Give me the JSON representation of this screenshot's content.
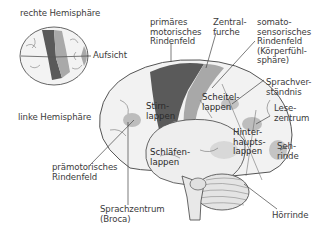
{
  "diagram": {
    "type": "labeled anatomical illustration"
  },
  "top_view": {
    "label_right_hemisphere": "rechte Hemisphäre",
    "label_left_hemisphere": "linke Hemisphäre",
    "label_view": "Aufsicht"
  },
  "labels": {
    "primary_motor": "primäres\nmotorisches\nRindenfeld",
    "central_sulcus": "Zentral-\nfurche",
    "somatosensory": "somato-\nsensorisches\nRindenfeld\n(Körperfühl-\nsphäre)",
    "parietal_lobe": "Scheitel-\nlappen",
    "frontal_lobe": "Stirn-\nlappen",
    "speech_comprehension": "Sprachver-\nständnis",
    "reading_center": "Lese-\nzentrum",
    "occipital_lobe": "Hinter-\nhaupts-\nlappen",
    "visual_cortex": "Seh-\nrinde",
    "temporal_lobe": "Schläfen-\nlappen",
    "premotor": "prämotorisches\nRindenfeld",
    "broca": "Sprachzentrum\n(Broca)",
    "auditory_cortex": "Hörrinde"
  },
  "colors": {
    "motor_area": "#5a5a5a",
    "somatosensory_area": "#a8a8a8",
    "functional_spot": "#b8b8b8",
    "brain_fill": "#f2f2f2",
    "outline": "#555555"
  }
}
